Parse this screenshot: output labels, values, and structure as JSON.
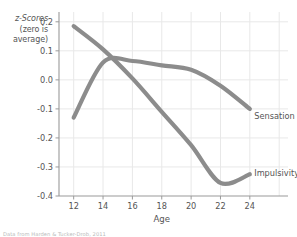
{
  "chart_data": {
    "type": "line",
    "title": "",
    "xlabel": "Age",
    "ylabel": "z-Scores (zero is average)",
    "ylabel_lines": [
      "z-Scores",
      "(zero is",
      "average)"
    ],
    "x": [
      12,
      14,
      16,
      18,
      20,
      22,
      24
    ],
    "xticks": [
      "12",
      "14",
      "16",
      "18",
      "20",
      "22",
      "24"
    ],
    "yticks": [
      "0.2",
      "0.1",
      "0.0",
      "-0.1",
      "-0.2",
      "-0.3",
      "-0.4"
    ],
    "ytick_values": [
      0.2,
      0.1,
      0.0,
      -0.1,
      -0.2,
      -0.3,
      -0.4
    ],
    "xlim": [
      11.0,
      26.6
    ],
    "ylim": [
      -0.4,
      0.22
    ],
    "grid": true,
    "legend_position": "inline-right",
    "series": [
      {
        "name": "Sensation seeking",
        "values": [
          -0.13,
          0.06,
          0.065,
          0.05,
          0.035,
          -0.02,
          -0.1
        ],
        "color": "#8c8c8c",
        "label_x": 24.3,
        "label_y": -0.122
      },
      {
        "name": "Impulsivity",
        "values": [
          0.185,
          0.105,
          0.005,
          -0.11,
          -0.225,
          -0.355,
          -0.325
        ],
        "color": "#8c8c8c",
        "label_x": 24.3,
        "label_y": -0.318
      }
    ],
    "source_note": "Data from Harden & Tucker-Drob, 2011",
    "colors": {
      "line": "#8c8c8c",
      "grid": "#e8e8e8",
      "axis": "#9a9a9a",
      "text": "#555555",
      "background": "#ffffff"
    }
  }
}
